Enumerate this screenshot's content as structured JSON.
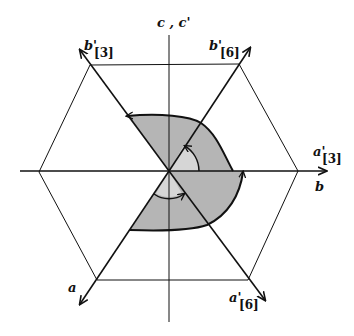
{
  "diagram": {
    "labels": {
      "c_axis": "c , c'",
      "b_prime_3": "b'",
      "b_prime_3_sub": "[3]",
      "b_prime_6": "b'",
      "b_prime_6_sub": "[6]",
      "a_prime_3": "a'",
      "a_prime_3_sub": "[3]",
      "b_axis": "b",
      "a_axis": "a",
      "a_prime_6": "a'",
      "a_prime_6_sub": "[6]"
    },
    "colors": {
      "line": "#111111",
      "shade_dark": "#b5b5b5",
      "shade_light": "#d6d6d6",
      "background": "#ffffff"
    },
    "geometry": {
      "center": [
        169,
        171
      ],
      "hexagon_vertices": [
        [
          298,
          171
        ],
        [
          239,
          64
        ],
        [
          90,
          65
        ],
        [
          39,
          172
        ],
        [
          97,
          280
        ],
        [
          248,
          280
        ]
      ],
      "axis_directions_deg": {
        "b": 0,
        "b_prime_6": 60,
        "c": 90,
        "b_prime_3": 120,
        "a": 240,
        "a_prime_6": 300
      }
    }
  }
}
